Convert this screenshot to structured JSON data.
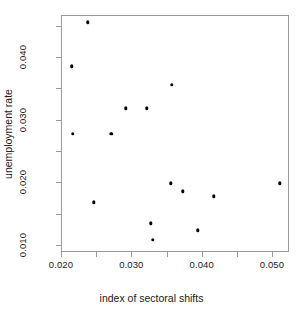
{
  "chart_data": {
    "type": "scatter",
    "title": "",
    "xlabel": "index of sectoral shifts",
    "ylabel": "unemployment rate",
    "xlim": [
      0.0194,
      0.0518
    ],
    "ylim": [
      0.0086,
      0.0464
    ],
    "grid": false,
    "legend": null,
    "x_ticks": [
      0.02,
      0.025,
      0.03,
      0.035,
      0.04,
      0.045,
      0.05
    ],
    "x_tick_labels": [
      "0.020",
      "",
      "0.030",
      "",
      "0.040",
      "",
      "0.050"
    ],
    "y_ticks": [
      0.01,
      0.015,
      0.02,
      0.025,
      0.03,
      0.035,
      0.04,
      0.045
    ],
    "y_tick_labels": [
      "0.010",
      "",
      "0.020",
      "",
      "0.030",
      "",
      "0.040",
      ""
    ],
    "marker": "filled-circle",
    "marker_color": "#000000",
    "points": [
      {
        "x": 0.0237,
        "y": 0.0457
      },
      {
        "x": 0.0214,
        "y": 0.0387
      },
      {
        "x": 0.0356,
        "y": 0.0357
      },
      {
        "x": 0.0291,
        "y": 0.032
      },
      {
        "x": 0.0321,
        "y": 0.032
      },
      {
        "x": 0.0215,
        "y": 0.0279
      },
      {
        "x": 0.027,
        "y": 0.0279
      },
      {
        "x": 0.0355,
        "y": 0.02
      },
      {
        "x": 0.0372,
        "y": 0.0187
      },
      {
        "x": 0.051,
        "y": 0.02
      },
      {
        "x": 0.0416,
        "y": 0.0179
      },
      {
        "x": 0.0245,
        "y": 0.017
      },
      {
        "x": 0.0326,
        "y": 0.0136
      },
      {
        "x": 0.0393,
        "y": 0.0125
      },
      {
        "x": 0.0329,
        "y": 0.011
      }
    ]
  },
  "axes": {
    "x_tick_labels_visible": [
      "0.020",
      "0.030",
      "0.040",
      "0.050"
    ],
    "y_tick_labels_visible": [
      "0.010",
      "0.020",
      "0.030",
      "0.040"
    ]
  }
}
